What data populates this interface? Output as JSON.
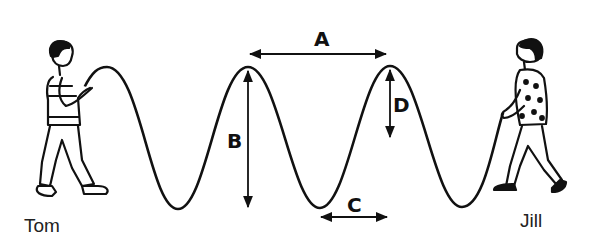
{
  "diagram": {
    "type": "transverse wave on a rope",
    "people": {
      "left": {
        "name": "Tom"
      },
      "right": {
        "name": "Jill"
      }
    },
    "labels": {
      "A": "A",
      "B": "B",
      "C": "C",
      "D": "D"
    },
    "annotations": [
      {
        "label": "A",
        "meaning": "horizontal arrow between two adjacent crests"
      },
      {
        "label": "B",
        "meaning": "vertical arrow from crest to trough"
      },
      {
        "label": "C",
        "meaning": "horizontal arrow from trough to crest position"
      },
      {
        "label": "D",
        "meaning": "vertical arrow from crest to middle"
      }
    ],
    "colors": {
      "line": "#111111",
      "background": "#ffffff"
    }
  }
}
